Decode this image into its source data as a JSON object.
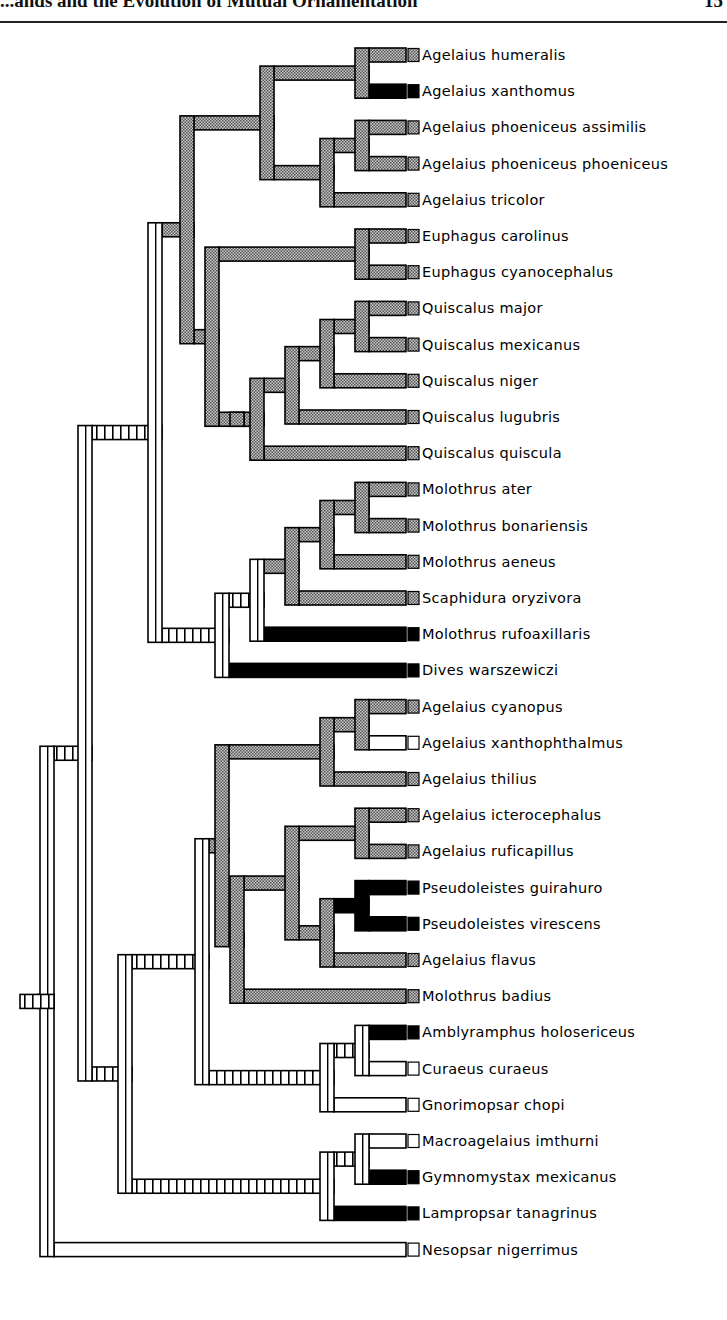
{
  "header": {
    "title": "...ands and the Evolution of Mutual Ornamentation",
    "page_number": "15"
  },
  "legend_states": {
    "gray": "checkered gray (#8a8a8a)",
    "black": "solid black (#000000)",
    "white": "open/white (#ffffff)",
    "hatched": "ladder-hatched (equivocal)"
  },
  "leaves": [
    {
      "name": "Agelaius humeralis",
      "state": "gray"
    },
    {
      "name": "Agelaius xanthomus",
      "state": "black"
    },
    {
      "name": "Agelaius phoeniceus assimilis",
      "state": "gray"
    },
    {
      "name": "Agelaius phoeniceus phoeniceus",
      "state": "gray"
    },
    {
      "name": "Agelaius tricolor",
      "state": "gray"
    },
    {
      "name": "Euphagus carolinus",
      "state": "gray"
    },
    {
      "name": "Euphagus cyanocephalus",
      "state": "gray"
    },
    {
      "name": "Quiscalus major",
      "state": "gray"
    },
    {
      "name": "Quiscalus mexicanus",
      "state": "gray"
    },
    {
      "name": "Quiscalus niger",
      "state": "gray"
    },
    {
      "name": "Quiscalus lugubris",
      "state": "gray"
    },
    {
      "name": "Quiscalus quiscula",
      "state": "gray"
    },
    {
      "name": "Molothrus ater",
      "state": "gray"
    },
    {
      "name": "Molothrus bonariensis",
      "state": "gray"
    },
    {
      "name": "Molothrus aeneus",
      "state": "gray"
    },
    {
      "name": "Scaphidura oryzivora",
      "state": "gray"
    },
    {
      "name": "Molothrus rufoaxillaris",
      "state": "black"
    },
    {
      "name": "Dives warszewiczi",
      "state": "black"
    },
    {
      "name": "Agelaius cyanopus",
      "state": "gray"
    },
    {
      "name": "Agelaius xanthophthalmus",
      "state": "white"
    },
    {
      "name": "Agelaius thilius",
      "state": "gray"
    },
    {
      "name": "Agelaius icterocephalus",
      "state": "gray"
    },
    {
      "name": "Agelaius ruficapillus",
      "state": "gray"
    },
    {
      "name": "Pseudoleistes guirahuro",
      "state": "black"
    },
    {
      "name": "Pseudoleistes virescens",
      "state": "black"
    },
    {
      "name": "Agelaius flavus",
      "state": "gray"
    },
    {
      "name": "Molothrus badius",
      "state": "gray"
    },
    {
      "name": "Amblyramphus holosericeus",
      "state": "black"
    },
    {
      "name": "Curaeus curaeus",
      "state": "white"
    },
    {
      "name": "Gnorimopsar chopi",
      "state": "white"
    },
    {
      "name": "Macroagelaius imthurni",
      "state": "white"
    },
    {
      "name": "Gymnomystax mexicanus",
      "state": "black"
    },
    {
      "name": "Lampropsar tanagrinus",
      "state": "black"
    },
    {
      "name": "Nesopsar nigerrimus",
      "state": "white"
    }
  ]
}
